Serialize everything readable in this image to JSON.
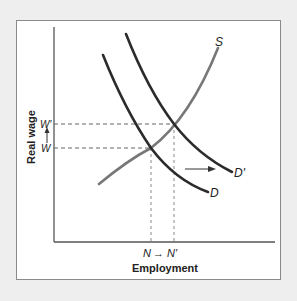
{
  "diagram": {
    "y_axis_label": "Real wage",
    "x_axis_label": "Employment",
    "curves": [
      {
        "id": "S",
        "label": "S",
        "kind": "supply"
      },
      {
        "id": "D",
        "label": "D",
        "kind": "demand"
      },
      {
        "id": "Dp",
        "label": "D′",
        "kind": "demand-shifted"
      }
    ],
    "y_ticks": [
      {
        "label": "W′"
      },
      {
        "label": "W"
      }
    ],
    "x_ticks": {
      "from": "N",
      "arrow": "→",
      "to": "N′"
    },
    "shift_arrow": "rightward shift of demand from D to D′",
    "colors": {
      "background": "#eeeeee",
      "panel": "#ffffff",
      "demand_curve": "#2b2b2b",
      "supply_curve": "#777777",
      "axis": "#555555",
      "dashed": "#666666"
    }
  }
}
